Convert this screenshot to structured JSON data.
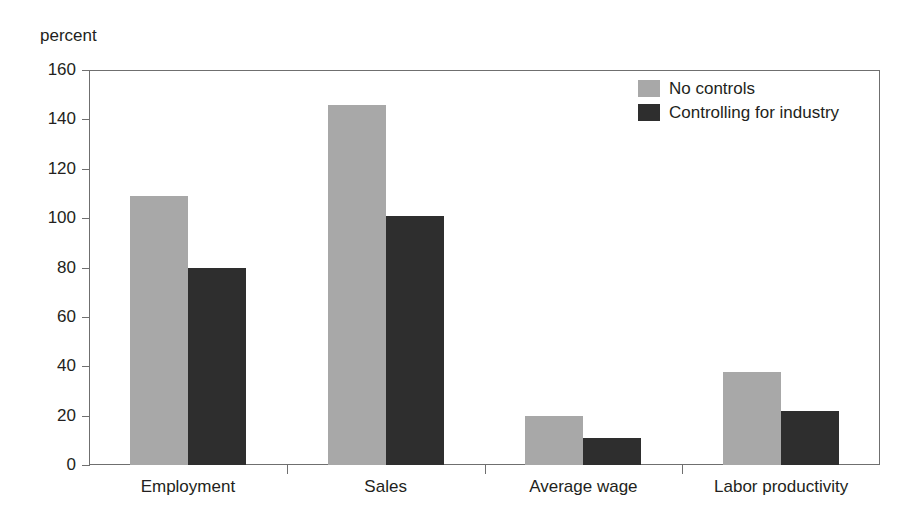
{
  "chart_data": {
    "type": "bar",
    "title": "",
    "subtitle": "",
    "xlabel": "",
    "ylabel": "percent",
    "ylim": [
      0,
      160
    ],
    "ytick_step": 20,
    "yticks": [
      160,
      140,
      120,
      100,
      80,
      60,
      40,
      20,
      0
    ],
    "ytick_labels": [
      "160",
      "140",
      "120",
      "100",
      "80",
      "60",
      "40",
      "20",
      "0"
    ],
    "grid": false,
    "legend_position": "top-right",
    "categories": [
      "Employment",
      "Sales",
      "Average wage",
      "Labor productivity"
    ],
    "series": [
      {
        "name": "No controls",
        "color": "#a8a8a8",
        "values": [
          109,
          146,
          20,
          37.5
        ]
      },
      {
        "name": "Controlling for industry",
        "color": "#2e2e2e",
        "values": [
          80,
          101,
          11,
          22
        ]
      }
    ]
  },
  "axis": {
    "unit_label": "percent"
  },
  "legend": {
    "entries": [
      {
        "label": "No controls",
        "swatch": "light-gray-swatch",
        "color": "#a8a8a8"
      },
      {
        "label": "Controlling for industry",
        "swatch": "dark-gray-swatch",
        "color": "#2e2e2e"
      }
    ]
  },
  "colors": {
    "series_light": "#a8a8a8",
    "series_dark": "#2e2e2e",
    "axis_line": "#6f6f6f",
    "text": "#231f20",
    "background": "#ffffff"
  }
}
